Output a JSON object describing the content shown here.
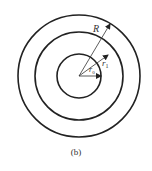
{
  "diagram": {
    "caption": "(b)",
    "labels": {
      "R": "R",
      "r1": "r",
      "r1_sub": "1",
      "r0": "r",
      "r0_sub": "0"
    },
    "circles": [
      {
        "name": "outer",
        "radius_label": "R"
      },
      {
        "name": "middle",
        "radius_label": "r1"
      },
      {
        "name": "inner",
        "radius_label": "r0"
      }
    ],
    "colors": {
      "stroke": "#222222",
      "background": "#ffffff"
    }
  }
}
